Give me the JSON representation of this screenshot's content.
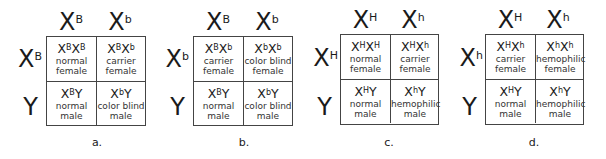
{
  "figure": {
    "squares": [
      {
        "caption": "a.",
        "top": [
          {
            "base": "X",
            "sup": "B"
          },
          {
            "base": "X",
            "sup": "b"
          }
        ],
        "side": [
          {
            "base": "X",
            "sup": "B"
          },
          {
            "base": "Y",
            "sup": ""
          }
        ],
        "cells": [
          [
            {
              "g1": "X",
              "s1": "B",
              "g2": "X",
              "s2": "B",
              "p1": "normal",
              "p2": "female"
            },
            {
              "g1": "X",
              "s1": "B",
              "g2": "X",
              "s2": "b",
              "p1": "carrier",
              "p2": "female"
            }
          ],
          [
            {
              "g1": "X",
              "s1": "B",
              "g2": "Y",
              "s2": "",
              "p1": "normal",
              "p2": "male"
            },
            {
              "g1": "X",
              "s1": "b",
              "g2": "Y",
              "s2": "",
              "p1": "color blind",
              "p2": "male"
            }
          ]
        ]
      },
      {
        "caption": "b.",
        "top": [
          {
            "base": "X",
            "sup": "B"
          },
          {
            "base": "X",
            "sup": "b"
          }
        ],
        "side": [
          {
            "base": "X",
            "sup": "b"
          },
          {
            "base": "Y",
            "sup": ""
          }
        ],
        "cells": [
          [
            {
              "g1": "X",
              "s1": "B",
              "g2": "X",
              "s2": "b",
              "p1": "carrier",
              "p2": "female"
            },
            {
              "g1": "X",
              "s1": "b",
              "g2": "X",
              "s2": "b",
              "p1": "color blind",
              "p2": "female"
            }
          ],
          [
            {
              "g1": "X",
              "s1": "B",
              "g2": "Y",
              "s2": "",
              "p1": "normal",
              "p2": "male"
            },
            {
              "g1": "X",
              "s1": "b",
              "g2": "Y",
              "s2": "",
              "p1": "color blind",
              "p2": "male"
            }
          ]
        ]
      },
      {
        "caption": "c.",
        "top": [
          {
            "base": "X",
            "sup": "H"
          },
          {
            "base": "X",
            "sup": "h"
          }
        ],
        "side": [
          {
            "base": "X",
            "sup": "H"
          },
          {
            "base": "Y",
            "sup": ""
          }
        ],
        "cells": [
          [
            {
              "g1": "X",
              "s1": "H",
              "g2": "X",
              "s2": "H",
              "p1": "normal",
              "p2": "female"
            },
            {
              "g1": "X",
              "s1": "H",
              "g2": "X",
              "s2": "h",
              "p1": "carrier",
              "p2": "female"
            }
          ],
          [
            {
              "g1": "X",
              "s1": "H",
              "g2": "Y",
              "s2": "",
              "p1": "normal",
              "p2": "male"
            },
            {
              "g1": "X",
              "s1": "h",
              "g2": "Y",
              "s2": "",
              "p1": "hemophilic",
              "p2": "male"
            }
          ]
        ]
      },
      {
        "caption": "d.",
        "top": [
          {
            "base": "X",
            "sup": "H"
          },
          {
            "base": "X",
            "sup": "h"
          }
        ],
        "side": [
          {
            "base": "X",
            "sup": "h"
          },
          {
            "base": "Y",
            "sup": ""
          }
        ],
        "cells": [
          [
            {
              "g1": "X",
              "s1": "H",
              "g2": "X",
              "s2": "h",
              "p1": "carrier",
              "p2": "female"
            },
            {
              "g1": "X",
              "s1": "h",
              "g2": "X",
              "s2": "h",
              "p1": "hemophilic",
              "p2": "female"
            }
          ],
          [
            {
              "g1": "X",
              "s1": "H",
              "g2": "Y",
              "s2": "",
              "p1": "normal",
              "p2": "male"
            },
            {
              "g1": "X",
              "s1": "h",
              "g2": "Y",
              "s2": "",
              "p1": "hemophilic",
              "p2": "male"
            }
          ]
        ]
      }
    ]
  }
}
